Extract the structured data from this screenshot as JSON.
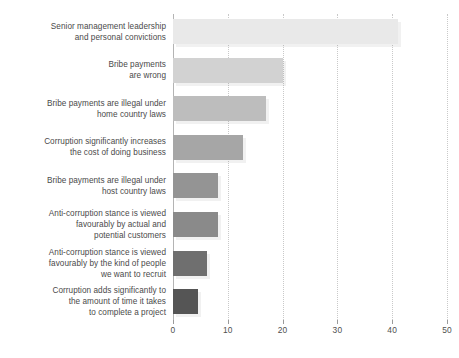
{
  "chart_data": {
    "type": "bar",
    "orientation": "horizontal",
    "title": "",
    "subtitle": "",
    "xlabel": "",
    "ylabel": "",
    "xlim": [
      0,
      50
    ],
    "xticks": [
      0,
      10,
      20,
      30,
      40,
      50
    ],
    "xtick_labels": [
      "0",
      "10",
      "20",
      "30",
      "40",
      "50"
    ],
    "grid": "vertical-dotted",
    "legend": "none",
    "categories": [
      "Senior management leadership\nand personal convictions",
      "Bribe payments\nare wrong",
      "Bribe payments are illegal under\nhome country laws",
      "Corruption significantly increases\nthe cost of doing business",
      "Bribe payments are illegal under\nhost country laws",
      "Anti-corruption stance is viewed\nfavourably by actual and\npotential customers",
      "Anti-corruption stance is viewed\nfavourably by the kind of people\nwe want to recruit",
      "Corruption adds significantly to\nthe amount of time it takes\nto complete a project"
    ],
    "values": [
      41,
      20,
      17,
      12.7,
      8.2,
      8.2,
      6.2,
      4.5
    ],
    "bar_colors": [
      "#e9e9e9",
      "#d2d2d2",
      "#bdbdbd",
      "#a6a6a6",
      "#949494",
      "#8a8a8a",
      "#6f6f6f",
      "#555555"
    ],
    "grid_color": "#c9c9c9",
    "axis_color": "#b4b4b4",
    "label_color": "#4a4a4a",
    "background": "#ffffff"
  }
}
